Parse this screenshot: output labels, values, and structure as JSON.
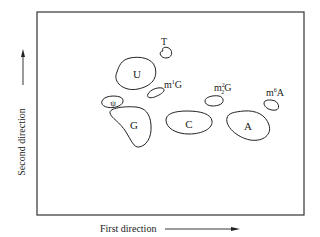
{
  "diagram": {
    "axes": {
      "x_label": "First direction",
      "y_label": "Second direction"
    },
    "spots": [
      {
        "id": "T",
        "label": "T"
      },
      {
        "id": "U",
        "label": "U"
      },
      {
        "id": "m1G",
        "label_base": "m",
        "sup": "1",
        "sub": "",
        "label_tail": "G"
      },
      {
        "id": "psi",
        "label": "ψ"
      },
      {
        "id": "G",
        "label": "G"
      },
      {
        "id": "C",
        "label": "C"
      },
      {
        "id": "m22G",
        "label_base": "m",
        "sup": "2",
        "sub": "2",
        "label_tail": "G"
      },
      {
        "id": "A",
        "label": "A"
      },
      {
        "id": "m6A",
        "label_base": "m",
        "sup": "6",
        "sub": "",
        "label_tail": "A"
      }
    ],
    "colors": {
      "ink": "#222222",
      "background": "#ffffff"
    }
  }
}
